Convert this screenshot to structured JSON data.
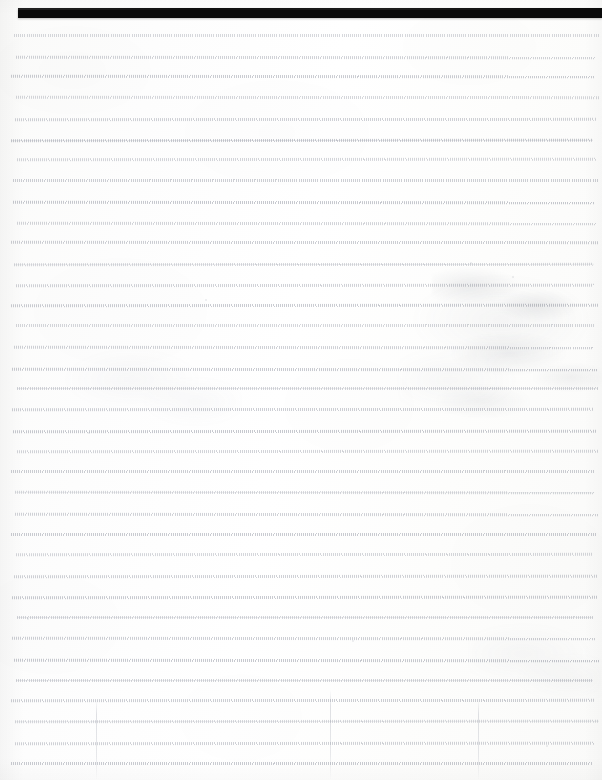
{
  "document": {
    "kind": "scanned-lined-page",
    "title": "",
    "page_width": 602,
    "page_height": 780,
    "background_color": "#fdfdfd",
    "visible_text": "",
    "note": "Blank scanned ruled notebook page; no legible characters are rendered in the pixels."
  },
  "top_bar": {
    "label": "",
    "color": "#0a0a0a",
    "x": 18,
    "y": 8,
    "width": 584,
    "height": 10
  },
  "ruling": {
    "color": "#787d8c",
    "first_line_y": 34,
    "line_spacing": 20.8,
    "line_count": 36,
    "left_x": 14,
    "right_x": 596,
    "style": "dotted-tick",
    "solid_line_indices": [
      5,
      11,
      17,
      22,
      28,
      31,
      33
    ]
  },
  "marks": {
    "smudges": [
      {
        "name": "upper-right-blotch",
        "x": 432,
        "y": 255,
        "width": 170,
        "height": 170
      },
      {
        "name": "upper-right-soft-halo",
        "x": 400,
        "y": 240,
        "width": 202,
        "height": 200
      },
      {
        "name": "mid-left-haze",
        "x": 60,
        "y": 330,
        "width": 180,
        "height": 110
      },
      {
        "name": "lower-right-haze",
        "x": 470,
        "y": 600,
        "width": 132,
        "height": 120
      }
    ],
    "vertical_lines": [
      {
        "name": "lower-center-guide",
        "x": 330,
        "y": 690,
        "height": 90
      },
      {
        "name": "lower-right-guide",
        "x": 478,
        "y": 700,
        "height": 80
      },
      {
        "name": "upper-left-guide",
        "x": 96,
        "y": 700,
        "height": 80
      }
    ],
    "flecks": [
      {
        "x": 205,
        "y": 299,
        "size": 2
      },
      {
        "x": 470,
        "y": 262,
        "size": 2
      },
      {
        "x": 512,
        "y": 276,
        "size": 2
      },
      {
        "x": 88,
        "y": 432,
        "size": 2
      },
      {
        "x": 352,
        "y": 640,
        "size": 2
      },
      {
        "x": 546,
        "y": 745,
        "size": 2
      },
      {
        "x": 27,
        "y": 618,
        "size": 2
      }
    ]
  }
}
